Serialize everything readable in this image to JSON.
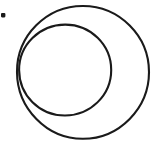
{
  "figure": {
    "title": "Two overlapping circles with a dot",
    "background_color": "#ffffff",
    "stroke_color": "#1a1a1a",
    "width": 156,
    "height": 143,
    "shapes": [
      {
        "name": "outer-circle",
        "type": "circle",
        "cx": 83,
        "cy": 72,
        "r": 66,
        "stroke_width": 2.1,
        "fill": "none",
        "label": "Outer circle"
      },
      {
        "name": "inner-circle",
        "type": "circle",
        "cx": 65,
        "cy": 70,
        "r": 46,
        "stroke_width": 2.1,
        "fill": "none",
        "label": "Inner circle"
      },
      {
        "name": "corner-dot",
        "type": "dot",
        "cx": 3,
        "cy": 15,
        "r": 2.2,
        "fill": "#1a1a1a",
        "label": "Small dot mark"
      }
    ]
  }
}
